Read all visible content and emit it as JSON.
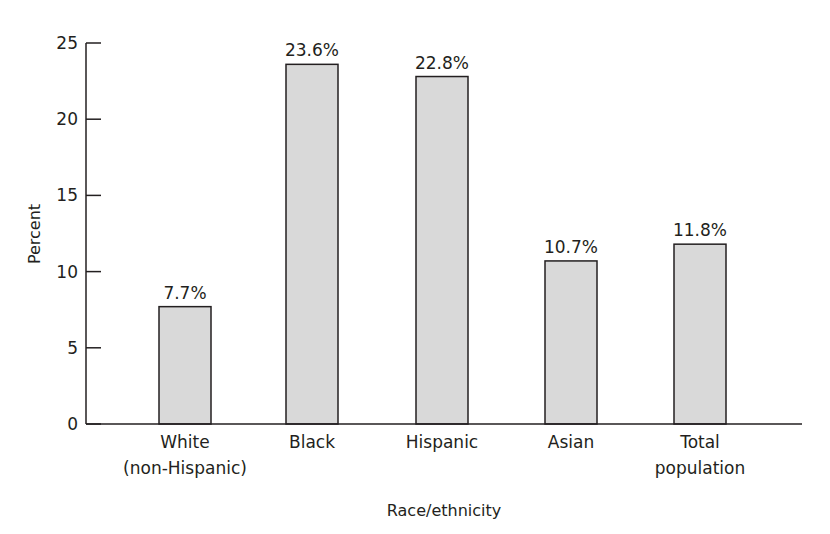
{
  "chart_data": {
    "type": "bar",
    "title": "",
    "xlabel": "Race/ethnicity",
    "ylabel": "Percent",
    "ylim": [
      0,
      25
    ],
    "yticks": [
      0,
      5,
      10,
      15,
      20,
      25
    ],
    "grid": false,
    "legend": null,
    "categories": [
      [
        "White",
        "(non-Hispanic)"
      ],
      [
        "Black"
      ],
      [
        "Hispanic"
      ],
      [
        "Asian"
      ],
      [
        "Total",
        "population"
      ]
    ],
    "category_names": [
      "White (non-Hispanic)",
      "Black",
      "Hispanic",
      "Asian",
      "Total population"
    ],
    "values": [
      7.7,
      23.6,
      22.8,
      10.7,
      11.8
    ],
    "value_labels": [
      "7.7%",
      "23.6%",
      "22.8%",
      "10.7%",
      "11.8%"
    ],
    "colors": {
      "bar_fill": "#d9d9d9",
      "bar_stroke": "#231f20",
      "axis": "#231f20"
    }
  }
}
